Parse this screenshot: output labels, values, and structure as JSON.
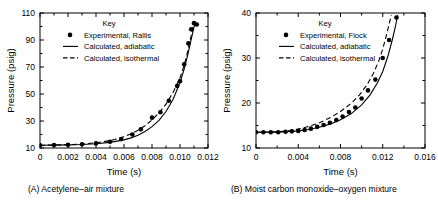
{
  "figure": {
    "panel_count": 2
  },
  "chart_data": [
    {
      "type": "scatter",
      "panel_id": "A",
      "caption": "(A) Acetylene–air mixture",
      "title": "",
      "xlabel": "Time (s)",
      "ylabel": "Pressure (psig)",
      "xlim": [
        0,
        0.012
      ],
      "ylim": [
        10,
        110
      ],
      "xticks": [
        0,
        0.002,
        0.004,
        0.006,
        0.008,
        0.01,
        0.012
      ],
      "xticklabels": [
        "0",
        "0.002",
        "0.004",
        "0.006",
        "0.008",
        "0.010",
        "0.012"
      ],
      "yticks": [
        10,
        30,
        50,
        70,
        90,
        110
      ],
      "yticklabels": [
        "10",
        "30",
        "50",
        "70",
        "90",
        "110"
      ],
      "grid": false,
      "legend_title": "Key",
      "legend_position": "top-center",
      "series": [
        {
          "name": "Experimental, Rallis",
          "style": "points",
          "marker": "filled-circle",
          "points": [
            [
              0.0,
              12.0
            ],
            [
              0.001,
              12.2
            ],
            [
              0.002,
              12.4
            ],
            [
              0.003,
              12.8
            ],
            [
              0.004,
              13.4
            ],
            [
              0.005,
              14.6
            ],
            [
              0.0058,
              16.6
            ],
            [
              0.0066,
              20.0
            ],
            [
              0.0072,
              23.8
            ],
            [
              0.008,
              32.5
            ],
            [
              0.0086,
              36.5
            ],
            [
              0.0092,
              45.0
            ],
            [
              0.0098,
              56.0
            ],
            [
              0.01,
              59.5
            ],
            [
              0.0103,
              72.0
            ],
            [
              0.0106,
              87.5
            ],
            [
              0.0108,
              98.0
            ],
            [
              0.011,
              102.5
            ],
            [
              0.0112,
              101.5
            ]
          ]
        },
        {
          "name": "Calculated, adiabatic",
          "style": "solid-line",
          "points": [
            [
              0.0,
              12.0
            ],
            [
              0.001,
              12.1
            ],
            [
              0.002,
              12.3
            ],
            [
              0.003,
              12.6
            ],
            [
              0.004,
              13.2
            ],
            [
              0.005,
              14.2
            ],
            [
              0.006,
              16.0
            ],
            [
              0.0065,
              17.5
            ],
            [
              0.007,
              19.5
            ],
            [
              0.0075,
              22.2
            ],
            [
              0.008,
              25.8
            ],
            [
              0.0085,
              30.5
            ],
            [
              0.009,
              37.0
            ],
            [
              0.0095,
              46.0
            ],
            [
              0.01,
              58.5
            ],
            [
              0.0103,
              68.5
            ],
            [
              0.0106,
              81.0
            ],
            [
              0.0108,
              90.5
            ],
            [
              0.011,
              99.5
            ],
            [
              0.0111,
              103.5
            ]
          ]
        },
        {
          "name": "Calculated, isothermal",
          "style": "dashed-line",
          "points": [
            [
              0.0,
              12.0
            ],
            [
              0.001,
              12.2
            ],
            [
              0.002,
              12.5
            ],
            [
              0.003,
              13.0
            ],
            [
              0.004,
              13.9
            ],
            [
              0.005,
              15.4
            ],
            [
              0.0058,
              17.6
            ],
            [
              0.0065,
              20.5
            ],
            [
              0.007,
              23.2
            ],
            [
              0.0075,
              26.5
            ],
            [
              0.008,
              30.8
            ],
            [
              0.0085,
              36.0
            ],
            [
              0.009,
              42.5
            ],
            [
              0.0095,
              51.0
            ],
            [
              0.01,
              62.0
            ],
            [
              0.0103,
              71.5
            ],
            [
              0.0105,
              79.5
            ],
            [
              0.0107,
              88.5
            ],
            [
              0.0109,
              98.0
            ],
            [
              0.011,
              103.0
            ]
          ]
        }
      ]
    },
    {
      "type": "scatter",
      "panel_id": "B",
      "caption": "(B) Moist carbon monoxide–oxygen mixture",
      "title": "",
      "xlabel": "Time (s)",
      "ylabel": "Pressure (psig)",
      "xlim": [
        0,
        0.016
      ],
      "ylim": [
        10,
        40
      ],
      "xticks": [
        0,
        0.004,
        0.008,
        0.012,
        0.016
      ],
      "xticklabels": [
        "0",
        "0.004",
        "0.008",
        "0.012",
        "0.016"
      ],
      "yticks": [
        10,
        20,
        30,
        40
      ],
      "yticklabels": [
        "10",
        "20",
        "30",
        "40"
      ],
      "grid": false,
      "legend_title": "Key",
      "legend_position": "top-center",
      "series": [
        {
          "name": "Experimental, Fiock",
          "style": "points",
          "marker": "filled-circle",
          "points": [
            [
              0.0,
              13.5
            ],
            [
              0.0007,
              13.5
            ],
            [
              0.0014,
              13.5
            ],
            [
              0.0021,
              13.5
            ],
            [
              0.0028,
              13.6
            ],
            [
              0.0034,
              13.7
            ],
            [
              0.004,
              13.8
            ],
            [
              0.0046,
              14.0
            ],
            [
              0.0052,
              14.3
            ],
            [
              0.0058,
              14.7
            ],
            [
              0.0064,
              15.1
            ],
            [
              0.007,
              15.6
            ],
            [
              0.0076,
              16.2
            ],
            [
              0.0082,
              17.0
            ],
            [
              0.0088,
              18.0
            ],
            [
              0.0094,
              19.0
            ],
            [
              0.01,
              21.0
            ],
            [
              0.0106,
              22.8
            ],
            [
              0.0113,
              25.2
            ],
            [
              0.012,
              30.0
            ],
            [
              0.0126,
              34.0
            ],
            [
              0.0133,
              39.0
            ]
          ]
        },
        {
          "name": "Calculated, adiabatic",
          "style": "solid-line",
          "points": [
            [
              0.0,
              13.5
            ],
            [
              0.002,
              13.5
            ],
            [
              0.003,
              13.6
            ],
            [
              0.004,
              13.8
            ],
            [
              0.005,
              14.1
            ],
            [
              0.006,
              14.6
            ],
            [
              0.007,
              15.3
            ],
            [
              0.008,
              16.3
            ],
            [
              0.009,
              17.6
            ],
            [
              0.01,
              19.6
            ],
            [
              0.0108,
              21.8
            ],
            [
              0.0115,
              24.5
            ],
            [
              0.012,
              27.0
            ],
            [
              0.0125,
              30.5
            ],
            [
              0.0129,
              34.0
            ],
            [
              0.0132,
              37.0
            ],
            [
              0.0134,
              39.5
            ]
          ]
        },
        {
          "name": "Calculated, isothermal",
          "style": "dashed-line",
          "points": [
            [
              0.0,
              13.5
            ],
            [
              0.002,
              13.6
            ],
            [
              0.003,
              13.8
            ],
            [
              0.004,
              14.2
            ],
            [
              0.005,
              14.8
            ],
            [
              0.006,
              15.6
            ],
            [
              0.007,
              16.7
            ],
            [
              0.008,
              18.1
            ],
            [
              0.009,
              19.9
            ],
            [
              0.0098,
              21.8
            ],
            [
              0.0105,
              24.0
            ],
            [
              0.0111,
              26.5
            ],
            [
              0.0116,
              29.2
            ],
            [
              0.012,
              32.0
            ],
            [
              0.0124,
              35.5
            ],
            [
              0.0127,
              38.5
            ],
            [
              0.0128,
              39.6
            ]
          ]
        }
      ]
    }
  ]
}
